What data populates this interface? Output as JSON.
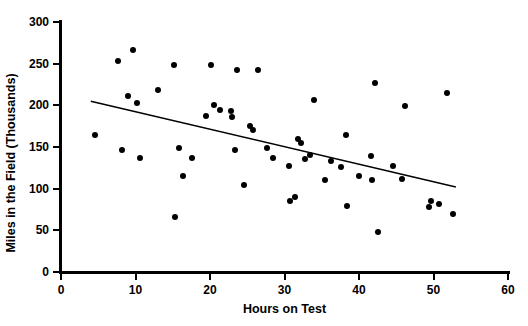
{
  "chart_data": {
    "type": "scatter",
    "title": "",
    "xlabel": "Hours on Test",
    "ylabel": "Miles in the Field (Thousands)",
    "xlim": [
      0,
      60
    ],
    "ylim": [
      0,
      300
    ],
    "xticks": [
      0,
      10,
      20,
      30,
      40,
      50,
      60
    ],
    "yticks": [
      0,
      50,
      100,
      150,
      200,
      250,
      300
    ],
    "xtick_labels": [
      "0",
      "10",
      "20",
      "30",
      "40",
      "50",
      "60"
    ],
    "ytick_labels": [
      "0",
      "50",
      "100",
      "150",
      "200",
      "250",
      "300"
    ],
    "grid": false,
    "legend": false,
    "marker": "filled-circle",
    "marker_color": "#000000",
    "points": [
      [
        4.5,
        164
      ],
      [
        7.6,
        253
      ],
      [
        8.2,
        147
      ],
      [
        9.0,
        211
      ],
      [
        9.6,
        266
      ],
      [
        10.2,
        203
      ],
      [
        10.6,
        137
      ],
      [
        13.0,
        219
      ],
      [
        15.2,
        249
      ],
      [
        15.3,
        66
      ],
      [
        15.8,
        149
      ],
      [
        16.4,
        115
      ],
      [
        17.6,
        137
      ],
      [
        19.4,
        187
      ],
      [
        20.2,
        249
      ],
      [
        20.5,
        200
      ],
      [
        21.4,
        194
      ],
      [
        22.8,
        193
      ],
      [
        23.0,
        186
      ],
      [
        23.3,
        147
      ],
      [
        23.6,
        243
      ],
      [
        24.6,
        105
      ],
      [
        25.4,
        175
      ],
      [
        25.8,
        170
      ],
      [
        26.4,
        243
      ],
      [
        27.6,
        149
      ],
      [
        28.4,
        137
      ],
      [
        30.6,
        127
      ],
      [
        30.8,
        85
      ],
      [
        31.4,
        90
      ],
      [
        31.8,
        160
      ],
      [
        32.2,
        155
      ],
      [
        32.8,
        136
      ],
      [
        33.4,
        140
      ],
      [
        34.0,
        206
      ],
      [
        35.4,
        111
      ],
      [
        36.2,
        133
      ],
      [
        37.6,
        126
      ],
      [
        38.2,
        165
      ],
      [
        38.4,
        79
      ],
      [
        40.0,
        115
      ],
      [
        41.6,
        139
      ],
      [
        41.8,
        111
      ],
      [
        42.2,
        227
      ],
      [
        42.6,
        48
      ],
      [
        44.6,
        127
      ],
      [
        45.8,
        112
      ],
      [
        46.2,
        199
      ],
      [
        49.4,
        78
      ],
      [
        49.6,
        85
      ],
      [
        50.8,
        82
      ],
      [
        51.8,
        215
      ],
      [
        52.6,
        70
      ]
    ],
    "trendline": {
      "type": "linear-fit",
      "x_start": 4.0,
      "y_start": 205,
      "x_end": 53.0,
      "y_end": 102,
      "color": "#000000"
    }
  }
}
